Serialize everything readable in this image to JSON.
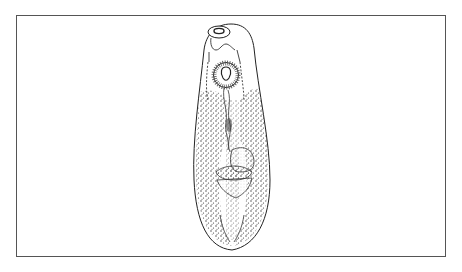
{
  "figure": {
    "frame_color": "#555555",
    "ink_color": "#222222",
    "background": "#ffffff"
  }
}
